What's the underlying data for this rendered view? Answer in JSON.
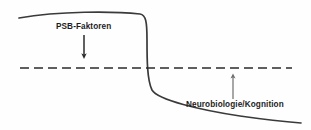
{
  "figure": {
    "type": "conceptual-schematic",
    "background_color": "#fefefe",
    "labels": {
      "upper_label": "PSB-Faktoren",
      "lower_label": "Neurobiologie/Kognition"
    },
    "annotations": [
      {
        "name": "down-arrow",
        "direction": "down",
        "color": "#2b2b2b",
        "from_label": "PSB-Faktoren",
        "x": 84,
        "y_start": 35,
        "y_end": 58
      },
      {
        "name": "up-arrow",
        "direction": "up",
        "color": "#6d6d6d",
        "from_label": "Neurobiologie/Kognition",
        "x": 233,
        "y_start": 99,
        "y_end": 74
      }
    ],
    "baseline": {
      "name": "threshold-dashed-line",
      "style": "dashed",
      "color": "#2b2b2b",
      "y": 68,
      "x_start": 20,
      "x_end": 292,
      "dash": 9,
      "gap": 5,
      "width": 1.6
    },
    "curve": {
      "name": "sigmoid-transition-curve",
      "color": "#3a3a3a",
      "width": 1.7,
      "shape": "descending sigmoid / step transition",
      "path": "M 19,18 C 60,11 112,11 140,14 C 146,15 147,22 147,40 C 147,58 147,80 152,90 C 158,100 200,110 240,116 C 268,120 288,122 301,123",
      "start": [
        19,
        18
      ],
      "plateau_high": 14,
      "inflection_x": 147,
      "plateau_low": 123,
      "end": [
        301,
        123
      ]
    }
  },
  "chart_data": {
    "type": "line",
    "title": "",
    "xlabel": "",
    "ylabel": "",
    "grid": false,
    "legend": "none",
    "annotations": [
      "PSB-Faktoren",
      "Neurobiologie/Kognition"
    ],
    "series": [
      {
        "name": "sigmoid-transition-curve",
        "x": [
          19,
          60,
          100,
          140,
          146,
          147,
          149,
          152,
          165,
          200,
          240,
          270,
          301
        ],
        "y": [
          18,
          13,
          12,
          14,
          18,
          40,
          70,
          90,
          100,
          110,
          116,
          120,
          123
        ]
      },
      {
        "name": "threshold-dashed-line",
        "x": [
          20,
          292
        ],
        "y": [
          68,
          68
        ]
      }
    ]
  }
}
